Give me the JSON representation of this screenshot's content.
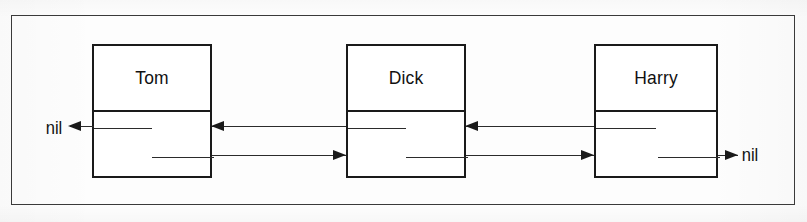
{
  "diagram": {
    "type": "doubly-linked-list",
    "outer_frame": {
      "label": "figure-border"
    },
    "nodes": [
      {
        "id": "node-tom",
        "name": "Tom",
        "x": 92,
        "y": 44,
        "width": 120,
        "height": 134
      },
      {
        "id": "node-dick",
        "name": "Dick",
        "x": 346,
        "y": 44,
        "width": 120,
        "height": 134
      },
      {
        "id": "node-harry",
        "name": "Harry",
        "x": 594,
        "y": 44,
        "width": 124,
        "height": 134
      }
    ],
    "terminators": [
      {
        "id": "nil-left",
        "label": "nil",
        "x": 45,
        "y": 119,
        "side": "left"
      },
      {
        "id": "nil-right",
        "label": "nil",
        "x": 741,
        "y": 146,
        "side": "right"
      }
    ],
    "links": [
      {
        "from": "node-tom",
        "to": "nil-left",
        "kind": "prev",
        "direction": "left"
      },
      {
        "from": "node-dick",
        "to": "node-tom",
        "kind": "prev",
        "direction": "left"
      },
      {
        "from": "node-harry",
        "to": "node-dick",
        "kind": "prev",
        "direction": "left"
      },
      {
        "from": "node-tom",
        "to": "node-dick",
        "kind": "next",
        "direction": "right"
      },
      {
        "from": "node-dick",
        "to": "node-harry",
        "kind": "next",
        "direction": "right"
      },
      {
        "from": "node-harry",
        "to": "nil-right",
        "kind": "next",
        "direction": "right"
      }
    ],
    "colors": {
      "ink": "#1a1a1a",
      "line": "#2b2b2b",
      "frame": "#3a3a3a",
      "paper": "#fdfdfd"
    }
  }
}
